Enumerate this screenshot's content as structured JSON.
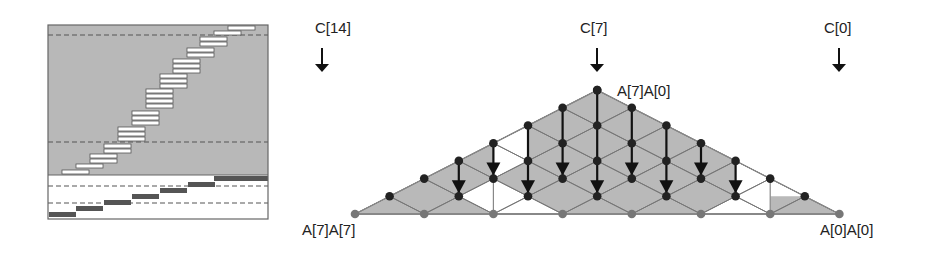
{
  "left_panel": {
    "box": {
      "x": 48,
      "y": 25,
      "w": 220,
      "h": 194
    },
    "gray_region_bottom": 175,
    "colors": {
      "gray": "#b8b8b8",
      "white": "#ffffff",
      "dark_bar": "#555555",
      "border": "#666666",
      "dash": "#555555"
    },
    "dashed_lines_y": [
      35,
      142,
      186,
      203
    ],
    "bar_width": 27,
    "bar_height": 4,
    "bar_pitch": 5,
    "white_bar_groups": [
      {
        "x": 228,
        "y": 26,
        "count": 1
      },
      {
        "x": 214,
        "y": 31,
        "count": 1
      },
      {
        "x": 200,
        "y": 37,
        "count": 2
      },
      {
        "x": 187,
        "y": 48,
        "count": 2
      },
      {
        "x": 173,
        "y": 59,
        "count": 3
      },
      {
        "x": 160,
        "y": 74,
        "count": 3
      },
      {
        "x": 146,
        "y": 89,
        "count": 4
      },
      {
        "x": 132,
        "y": 111,
        "count": 3
      },
      {
        "x": 118,
        "y": 127,
        "count": 3
      },
      {
        "x": 104,
        "y": 144,
        "count": 2
      },
      {
        "x": 90,
        "y": 154,
        "count": 2
      },
      {
        "x": 76,
        "y": 164,
        "count": 1
      },
      {
        "x": 62,
        "y": 170,
        "count": 1
      }
    ],
    "dark_bars": [
      {
        "x": 49,
        "y": 212
      },
      {
        "x": 76,
        "y": 206
      },
      {
        "x": 104,
        "y": 200
      },
      {
        "x": 132,
        "y": 194
      },
      {
        "x": 160,
        "y": 188
      },
      {
        "x": 188,
        "y": 182
      },
      {
        "x": 214,
        "y": 176
      },
      {
        "x": 241,
        "y": 176
      }
    ]
  },
  "triangle": {
    "origin_x": 355,
    "base_y": 214,
    "dx": 34.6,
    "dy": 17.7,
    "columns": 15,
    "colors": {
      "fill": "#b9b9b9",
      "edge_line": "#777777",
      "node": "#222222",
      "base_node": "#777777",
      "base_line": "#888888",
      "arrow": "#111111"
    }
  },
  "labels": {
    "c14": {
      "text": "C[14]",
      "x": 315,
      "y": 27
    },
    "c7": {
      "text": "C[7]",
      "x": 579,
      "y": 27
    },
    "c0": {
      "text": "C[0]",
      "x": 822,
      "y": 27
    },
    "apex": {
      "text": "A[7]A[0]",
      "x": 617,
      "y": 90
    },
    "left_base": {
      "text": "A[7]A[7]",
      "x": 302,
      "y": 222
    },
    "right_base": {
      "text": "A[0]A[0]",
      "x": 820,
      "y": 222
    }
  },
  "column_arrows": [
    {
      "label_key": "c14",
      "x": 322,
      "y1": 48,
      "y2": 72
    },
    {
      "label_key": "c7",
      "x": 597,
      "y1": 48,
      "y2": 72
    },
    {
      "label_key": "c0",
      "x": 839,
      "y1": 48,
      "y2": 72
    }
  ]
}
